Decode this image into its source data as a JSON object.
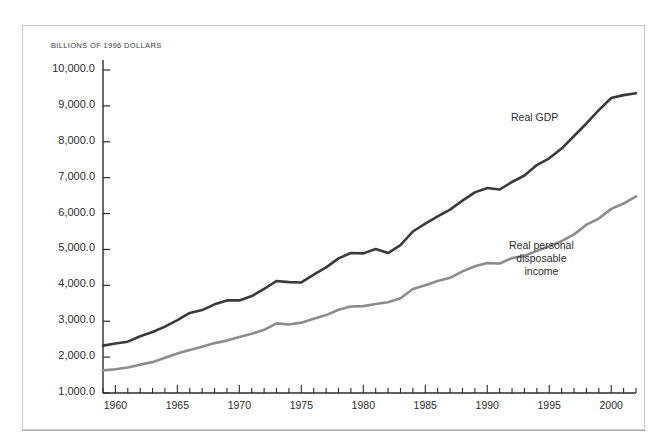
{
  "figure": {
    "unit_label": "BILLIONS OF 1996 DOLLARS",
    "frame_color": "#c8c8c8",
    "rule_color": "#b4b4b4",
    "background": "#ffffff"
  },
  "chart_data": {
    "type": "line",
    "title": "",
    "subtitle": "",
    "xlabel": "",
    "ylabel": "BILLIONS OF 1996 DOLLARS",
    "xlim": [
      1959,
      2002
    ],
    "ylim": [
      1000,
      10000
    ],
    "grid": false,
    "legend_position": "inline-annotation",
    "y_tick_labels": [
      "10,000.0",
      "9,000.0",
      "8,000.0",
      "7,000.0",
      "6,000.0",
      "5,000.0",
      "4,000.0",
      "3,000.0",
      "2,000.0",
      "1,000.0"
    ],
    "y_ticks": [
      10000,
      9000,
      8000,
      7000,
      6000,
      5000,
      4000,
      3000,
      2000,
      1000
    ],
    "x_tick_labels": [
      "1960",
      "1965",
      "1970",
      "1975",
      "1980",
      "1985",
      "1990",
      "1995",
      "2000"
    ],
    "x_ticks": [
      1960,
      1965,
      1970,
      1975,
      1980,
      1985,
      1990,
      1995,
      2000
    ],
    "x_minor_tick_interval": 1,
    "x": [
      1959,
      1960,
      1961,
      1962,
      1963,
      1964,
      1965,
      1966,
      1967,
      1968,
      1969,
      1970,
      1971,
      1972,
      1973,
      1974,
      1975,
      1976,
      1977,
      1978,
      1979,
      1980,
      1981,
      1982,
      1983,
      1984,
      1985,
      1986,
      1987,
      1988,
      1989,
      1990,
      1991,
      1992,
      1993,
      1994,
      1995,
      1996,
      1997,
      1998,
      1999,
      2000,
      2001,
      2002
    ],
    "series": [
      {
        "name": "Real GDP",
        "color": "#3a3a3a",
        "line_width": 2.6,
        "values": [
          2320,
          2380,
          2430,
          2580,
          2700,
          2850,
          3030,
          3230,
          3310,
          3470,
          3580,
          3580,
          3700,
          3900,
          4120,
          4090,
          4080,
          4300,
          4500,
          4750,
          4900,
          4890,
          5010,
          4900,
          5120,
          5500,
          5720,
          5920,
          6110,
          6360,
          6590,
          6710,
          6670,
          6880,
          7060,
          7350,
          7540,
          7810,
          8160,
          8510,
          8880,
          9220,
          9300,
          9350
        ]
      },
      {
        "name": "Real personal disposable income",
        "color": "#8c8c8c",
        "line_width": 2.6,
        "values": [
          1630,
          1660,
          1710,
          1790,
          1860,
          1980,
          2100,
          2200,
          2290,
          2390,
          2460,
          2560,
          2650,
          2760,
          2940,
          2910,
          2960,
          3070,
          3170,
          3320,
          3410,
          3420,
          3480,
          3530,
          3640,
          3900,
          4000,
          4120,
          4210,
          4390,
          4530,
          4620,
          4610,
          4760,
          4820,
          4960,
          5090,
          5230,
          5420,
          5690,
          5860,
          6130,
          6280,
          6480
        ]
      }
    ],
    "annotations": [
      {
        "name": "Real GDP",
        "text": "Real GDP",
        "lines": [
          "Real GDP"
        ]
      },
      {
        "name": "Real personal disposable income",
        "text": "Real personal disposable income",
        "lines": [
          "Real personal",
          "disposable",
          "income"
        ]
      }
    ]
  }
}
